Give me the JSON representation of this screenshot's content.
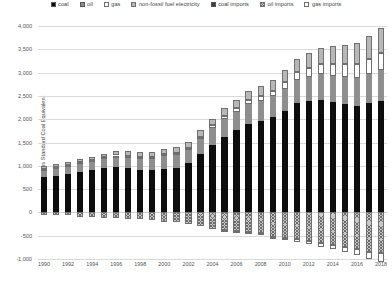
{
  "chart_data": {
    "type": "bar",
    "title": "",
    "subtitle": "",
    "xlabel": "",
    "ylabel": "Million tons Standard Coal Equivalent",
    "ylim": [
      -1000,
      4000
    ],
    "ytick_labels": [
      "4,000",
      "3,500",
      "3,000",
      "2,500",
      "2,000",
      "1,500",
      "1,000",
      "500",
      "0",
      "-500",
      "-1,000"
    ],
    "ytick_values": [
      4000,
      3500,
      3000,
      2500,
      2000,
      1500,
      1000,
      500,
      0,
      -500,
      -1000
    ],
    "grid": true,
    "legend_position": "top",
    "stacked": true,
    "x": [
      1990,
      1991,
      1992,
      1993,
      1994,
      1995,
      1996,
      1997,
      1998,
      1999,
      2000,
      2001,
      2002,
      2003,
      2004,
      2005,
      2006,
      2007,
      2008,
      2009,
      2010,
      2011,
      2012,
      2013,
      2014,
      2015,
      2016,
      2017,
      2018
    ],
    "xtick_labels": [
      "1990",
      "1992",
      "1994",
      "1996",
      "1998",
      "2000",
      "2002",
      "2004",
      "2006",
      "2008",
      "2010",
      "2012",
      "2014",
      "2016",
      "2018"
    ],
    "series": [
      {
        "name": "coal",
        "fill": "f-coal",
        "color": "#0d0d0d",
        "values": [
          760,
          790,
          820,
          860,
          900,
          950,
          980,
          960,
          920,
          900,
          930,
          960,
          1050,
          1250,
          1440,
          1620,
          1760,
          1900,
          1960,
          2040,
          2170,
          2340,
          2380,
          2420,
          2370,
          2320,
          2280,
          2340,
          2400
        ]
      },
      {
        "name": "oil",
        "fill": "f-oil",
        "color": "#8e8e8e",
        "values": [
          160,
          165,
          175,
          190,
          195,
          205,
          215,
          230,
          240,
          255,
          280,
          285,
          300,
          325,
          370,
          380,
          400,
          420,
          425,
          450,
          480,
          500,
          520,
          540,
          560,
          590,
          610,
          630,
          650
        ]
      },
      {
        "name": "gas",
        "fill": "f-gas",
        "color": "#ffffff",
        "values": [
          20,
          20,
          20,
          22,
          24,
          25,
          26,
          28,
          30,
          32,
          35,
          38,
          42,
          48,
          55,
          65,
          80,
          95,
          110,
          125,
          150,
          175,
          200,
          230,
          255,
          270,
          290,
          330,
          380
        ]
      },
      {
        "name": "non-fossil fuel electricity",
        "fill": "f-nonfossil",
        "color": "#b8b8b8",
        "values": [
          60,
          62,
          66,
          70,
          75,
          82,
          88,
          92,
          96,
          100,
          108,
          115,
          125,
          135,
          150,
          165,
          180,
          195,
          210,
          230,
          255,
          275,
          310,
          340,
          380,
          420,
          450,
          480,
          520
        ]
      },
      {
        "name": "coal imports",
        "fill": "f-coalimp",
        "color": "#3d3d3d",
        "negative": true,
        "values": [
          0,
          0,
          0,
          0,
          0,
          0,
          0,
          0,
          0,
          0,
          0,
          0,
          0,
          0,
          0,
          0,
          0,
          0,
          0,
          0,
          0,
          0,
          0,
          0,
          0,
          0,
          0,
          0,
          0
        ]
      },
      {
        "name": "oil imports",
        "fill": "f-oilimp",
        "color": "#c9c9c9",
        "negative": true,
        "values": [
          50,
          55,
          60,
          90,
          100,
          110,
          120,
          140,
          150,
          170,
          210,
          215,
          250,
          290,
          350,
          370,
          400,
          430,
          440,
          520,
          560,
          580,
          620,
          660,
          690,
          740,
          790,
          840,
          880
        ]
      },
      {
        "name": "gas imports",
        "fill": "f-gasimp",
        "color": "#ffffff",
        "negative": true,
        "values": [
          0,
          0,
          0,
          0,
          0,
          0,
          0,
          0,
          0,
          0,
          0,
          0,
          0,
          0,
          0,
          5,
          8,
          12,
          18,
          25,
          35,
          48,
          60,
          75,
          90,
          100,
          115,
          150,
          180
        ]
      }
    ]
  },
  "legend": {
    "items": [
      {
        "label": "coal",
        "fill": "f-coal"
      },
      {
        "label": "oil",
        "fill": "f-oil"
      },
      {
        "label": "gas",
        "fill": "f-gas"
      },
      {
        "label": "non-fossil fuel electricity",
        "fill": "f-nonfossil"
      },
      {
        "label": "coal imports",
        "fill": "f-coalimp"
      },
      {
        "label": "oil imports",
        "fill": "f-oilimp"
      },
      {
        "label": "gas imports",
        "fill": "f-gasimp"
      }
    ]
  }
}
